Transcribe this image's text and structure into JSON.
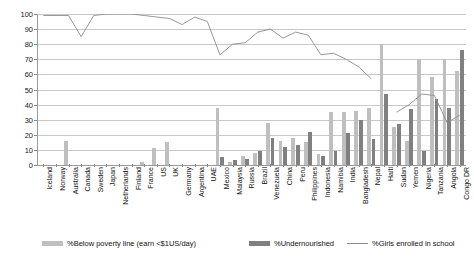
{
  "chart_data": {
    "type": "bar",
    "title": "",
    "subtitle": "",
    "xlabel": "",
    "ylabel": "",
    "ylim": [
      0,
      100
    ],
    "ytick_step": 10,
    "grid": true,
    "legend_position": "bottom",
    "yticks": [
      "0",
      "10",
      "20",
      "30",
      "40",
      "50",
      "60",
      "70",
      "80",
      "90",
      "100"
    ],
    "categories": [
      "Iceland",
      "Norway",
      "Australia",
      "Canada",
      "Sweden",
      "Japan",
      "Netherlands",
      "Finland",
      "France",
      "US",
      "UK",
      "Germany",
      "Argentina",
      "UAE",
      "Mexico",
      "Malaysia",
      "Russia",
      "Brazil",
      "Venezuela",
      "China",
      "Peru",
      "Philippines",
      "Indonesia",
      "Namibia",
      "India",
      "Bangladesh",
      "Nepal",
      "Haiti",
      "Sudan",
      "Yemen",
      "Nigeria",
      "Tanzania",
      "Angola",
      "Congo DR"
    ],
    "series": [
      {
        "name": "%Below poverty line (earn <$1US/day)",
        "type": "bar",
        "color": "#bfbfbf",
        "values": [
          0,
          0,
          16,
          0,
          0,
          0,
          0,
          0,
          2,
          11,
          15,
          0,
          0,
          0,
          38,
          2,
          6,
          8,
          28,
          16,
          18,
          15,
          7,
          35,
          35,
          36,
          38,
          80,
          25,
          16,
          70,
          58,
          70,
          62
        ]
      },
      {
        "name": "%Undernourished",
        "type": "bar",
        "color": "#808080",
        "values": [
          0,
          0,
          0,
          0,
          0,
          0,
          0,
          0,
          0,
          0,
          0,
          0,
          0,
          0,
          5,
          3,
          4,
          9,
          18,
          12,
          13,
          22,
          6,
          9,
          21,
          30,
          17,
          47,
          27,
          37,
          9,
          44,
          38,
          76
        ]
      },
      {
        "name": "%Girls enrolled in school",
        "type": "line",
        "color": "#8c8c8c",
        "values": [
          99,
          99,
          99,
          85,
          99,
          100,
          100,
          100,
          99,
          98,
          97,
          93,
          98,
          95,
          73,
          80,
          81,
          88,
          90,
          84,
          88,
          86,
          73,
          74,
          70,
          65,
          57,
          null,
          35,
          40,
          47,
          46,
          28,
          33
        ]
      }
    ]
  },
  "legend": {
    "items": [
      {
        "label": "%Below poverty line (earn <$1US/day)",
        "marker": "bar-swatch",
        "color": "#bfbfbf"
      },
      {
        "label": "%Undernourished",
        "marker": "bar-swatch",
        "color": "#808080"
      },
      {
        "label": "%Girls enrolled in school",
        "marker": "line-swatch",
        "color": "#8c8c8c"
      }
    ]
  }
}
